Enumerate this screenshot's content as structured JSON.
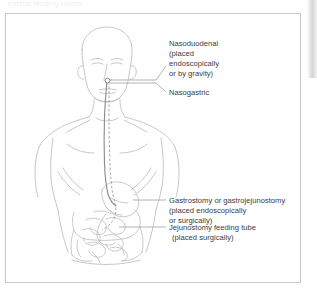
{
  "page": {
    "top_sliver_text": "enteral feeding routes",
    "background_color": "#ffffff",
    "frame_border_color": "#c9c9cb",
    "line_color": "#b9b9bd",
    "text_color": "#3b3b3d"
  },
  "labels": [
    {
      "id": "nasoduodenal",
      "lines": [
        "Nasoduodenal",
        "(placed",
        "endoscopically",
        "or by gravity)"
      ],
      "x": 163,
      "y": 29
    },
    {
      "id": "nasogastric",
      "lines": [
        "Nasogastric"
      ],
      "x": 163,
      "y": 76
    },
    {
      "id": "gastrostomy",
      "lines": [
        "Gastrostomy or gastrojejunostomy",
        "(placed endoscopically",
        "or surgically)"
      ],
      "x": 163,
      "y": 175
    },
    {
      "id": "jejunostomy",
      "lines": [
        "Jejunostomy feeding tube",
        "(placed surgically)"
      ],
      "x": 163,
      "y": 206
    }
  ],
  "tubes": [
    {
      "id": "nasogastric-tube",
      "style": "solid",
      "description": "tube from nose through esophagus ending in stomach"
    },
    {
      "id": "nasoduodenal-tube",
      "style": "dashed",
      "description": "tube from nose through stomach into duodenum"
    }
  ],
  "organs": [
    {
      "id": "stomach",
      "label": "stomach"
    },
    {
      "id": "small-intestine",
      "label": "small intestine / jejunum"
    },
    {
      "id": "large-intestine",
      "label": "large intestine"
    }
  ]
}
